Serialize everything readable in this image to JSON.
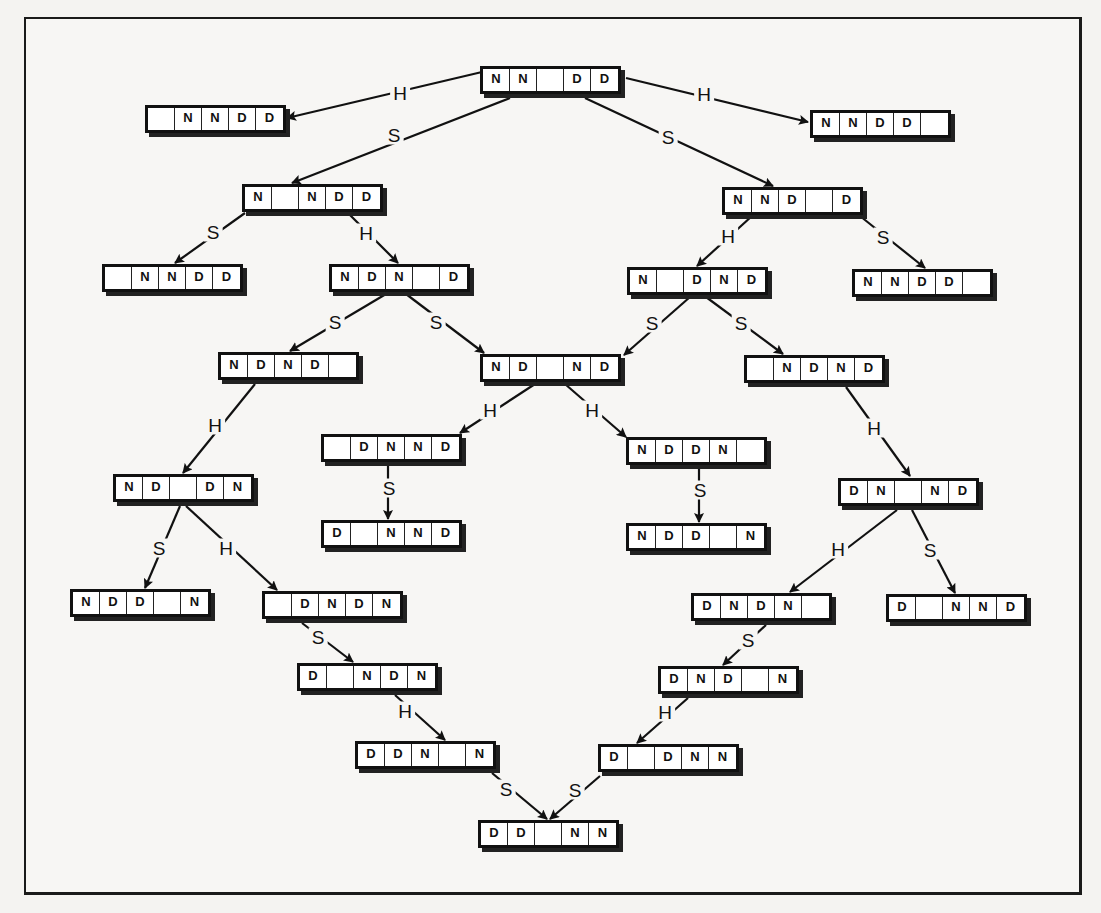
{
  "diagram": {
    "type": "state-transition-tree",
    "nodes": [
      {
        "id": "n0",
        "x": 480,
        "y": 66,
        "cells": [
          "N",
          "N",
          "",
          "D",
          "D"
        ]
      },
      {
        "id": "n1",
        "x": 145,
        "y": 105,
        "cells": [
          "",
          "N",
          "N",
          "D",
          "D"
        ]
      },
      {
        "id": "n2",
        "x": 810,
        "y": 110,
        "cells": [
          "N",
          "N",
          "D",
          "D",
          ""
        ]
      },
      {
        "id": "n3",
        "x": 242,
        "y": 184,
        "cells": [
          "N",
          "",
          "N",
          "D",
          "D"
        ]
      },
      {
        "id": "n4",
        "x": 722,
        "y": 187,
        "cells": [
          "N",
          "N",
          "D",
          "",
          "D"
        ]
      },
      {
        "id": "n5",
        "x": 102,
        "y": 264,
        "cells": [
          "",
          "N",
          "N",
          "D",
          "D"
        ]
      },
      {
        "id": "n6",
        "x": 329,
        "y": 264,
        "cells": [
          "N",
          "D",
          "N",
          "",
          "D"
        ]
      },
      {
        "id": "n7",
        "x": 627,
        "y": 267,
        "cells": [
          "N",
          "",
          "D",
          "N",
          "D"
        ]
      },
      {
        "id": "n8",
        "x": 852,
        "y": 269,
        "cells": [
          "N",
          "N",
          "D",
          "D",
          ""
        ]
      },
      {
        "id": "n9",
        "x": 218,
        "y": 352,
        "cells": [
          "N",
          "D",
          "N",
          "D",
          ""
        ]
      },
      {
        "id": "n10",
        "x": 480,
        "y": 354,
        "cells": [
          "N",
          "D",
          "",
          "N",
          "D"
        ]
      },
      {
        "id": "n11",
        "x": 744,
        "y": 355,
        "cells": [
          "",
          "N",
          "D",
          "N",
          "D"
        ]
      },
      {
        "id": "n12",
        "x": 321,
        "y": 434,
        "cells": [
          "",
          "D",
          "N",
          "N",
          "D"
        ]
      },
      {
        "id": "n13",
        "x": 626,
        "y": 437,
        "cells": [
          "N",
          "D",
          "D",
          "N",
          ""
        ]
      },
      {
        "id": "n14",
        "x": 113,
        "y": 474,
        "cells": [
          "N",
          "D",
          "",
          "D",
          "N"
        ]
      },
      {
        "id": "n15",
        "x": 321,
        "y": 520,
        "cells": [
          "D",
          "",
          "N",
          "N",
          "D"
        ]
      },
      {
        "id": "n16",
        "x": 626,
        "y": 523,
        "cells": [
          "N",
          "D",
          "D",
          "",
          "N"
        ]
      },
      {
        "id": "n17",
        "x": 838,
        "y": 478,
        "cells": [
          "D",
          "N",
          "",
          "N",
          "D"
        ]
      },
      {
        "id": "n18",
        "x": 70,
        "y": 589,
        "cells": [
          "N",
          "D",
          "D",
          "",
          "N"
        ]
      },
      {
        "id": "n19",
        "x": 262,
        "y": 591,
        "cells": [
          "",
          "D",
          "N",
          "D",
          "N"
        ]
      },
      {
        "id": "n20",
        "x": 691,
        "y": 593,
        "cells": [
          "D",
          "N",
          "D",
          "N",
          ""
        ]
      },
      {
        "id": "n21",
        "x": 886,
        "y": 594,
        "cells": [
          "D",
          "",
          "N",
          "N",
          "D"
        ]
      },
      {
        "id": "n22",
        "x": 297,
        "y": 663,
        "cells": [
          "D",
          "",
          "N",
          "D",
          "N"
        ]
      },
      {
        "id": "n23",
        "x": 658,
        "y": 666,
        "cells": [
          "D",
          "N",
          "D",
          "",
          "N"
        ]
      },
      {
        "id": "n24",
        "x": 355,
        "y": 741,
        "cells": [
          "D",
          "D",
          "N",
          "",
          "N"
        ]
      },
      {
        "id": "n25",
        "x": 598,
        "y": 744,
        "cells": [
          "D",
          "",
          "D",
          "N",
          "N"
        ]
      },
      {
        "id": "n26",
        "x": 478,
        "y": 820,
        "cells": [
          "D",
          "D",
          "",
          "N",
          "N"
        ]
      }
    ],
    "edges": [
      {
        "from": "n0",
        "to": "n1",
        "label": "H",
        "x1": 482,
        "y1": 72,
        "x2": 287,
        "y2": 118,
        "lx": 400,
        "ly": 93
      },
      {
        "from": "n0",
        "to": "n2",
        "label": "H",
        "x1": 626,
        "y1": 78,
        "x2": 808,
        "y2": 122,
        "lx": 704,
        "ly": 94
      },
      {
        "from": "n0",
        "to": "n3",
        "label": "S",
        "x1": 510,
        "y1": 98,
        "x2": 292,
        "y2": 183,
        "lx": 394,
        "ly": 135
      },
      {
        "from": "n0",
        "to": "n4",
        "label": "S",
        "x1": 585,
        "y1": 98,
        "x2": 773,
        "y2": 186,
        "lx": 668,
        "ly": 137
      },
      {
        "from": "n3",
        "to": "n5",
        "label": "S",
        "x1": 245,
        "y1": 213,
        "x2": 175,
        "y2": 263,
        "lx": 213,
        "ly": 232
      },
      {
        "from": "n3",
        "to": "n6",
        "label": "H",
        "x1": 348,
        "y1": 213,
        "x2": 398,
        "y2": 263,
        "lx": 366,
        "ly": 233
      },
      {
        "from": "n4",
        "to": "n7",
        "label": "H",
        "x1": 752,
        "y1": 216,
        "x2": 697,
        "y2": 266,
        "lx": 728,
        "ly": 236
      },
      {
        "from": "n4",
        "to": "n8",
        "label": "S",
        "x1": 860,
        "y1": 216,
        "x2": 925,
        "y2": 268,
        "lx": 883,
        "ly": 237
      },
      {
        "from": "n6",
        "to": "n9",
        "label": "S",
        "x1": 386,
        "y1": 294,
        "x2": 290,
        "y2": 351,
        "lx": 335,
        "ly": 322
      },
      {
        "from": "n6",
        "to": "n10",
        "label": "S",
        "x1": 406,
        "y1": 294,
        "x2": 484,
        "y2": 353,
        "lx": 436,
        "ly": 322
      },
      {
        "from": "n7",
        "to": "n10",
        "label": "S",
        "x1": 690,
        "y1": 297,
        "x2": 624,
        "y2": 355,
        "lx": 652,
        "ly": 323
      },
      {
        "from": "n7",
        "to": "n11",
        "label": "S",
        "x1": 706,
        "y1": 297,
        "x2": 783,
        "y2": 354,
        "lx": 741,
        "ly": 323
      },
      {
        "from": "n9",
        "to": "n14",
        "label": "H",
        "x1": 255,
        "y1": 384,
        "x2": 183,
        "y2": 473,
        "lx": 215,
        "ly": 425
      },
      {
        "from": "n10",
        "to": "n12",
        "label": "H",
        "x1": 535,
        "y1": 384,
        "x2": 460,
        "y2": 433,
        "lx": 490,
        "ly": 410
      },
      {
        "from": "n10",
        "to": "n13",
        "label": "H",
        "x1": 565,
        "y1": 384,
        "x2": 626,
        "y2": 437,
        "lx": 592,
        "ly": 410
      },
      {
        "from": "n11",
        "to": "n17",
        "label": "H",
        "x1": 846,
        "y1": 387,
        "x2": 910,
        "y2": 476,
        "lx": 874,
        "ly": 428
      },
      {
        "from": "n12",
        "to": "n15",
        "label": "S",
        "x1": 388,
        "y1": 466,
        "x2": 388,
        "y2": 519,
        "lx": 389,
        "ly": 488
      },
      {
        "from": "n13",
        "to": "n16",
        "label": "S",
        "x1": 699,
        "y1": 469,
        "x2": 699,
        "y2": 522,
        "lx": 700,
        "ly": 490
      },
      {
        "from": "n14",
        "to": "n18",
        "label": "S",
        "x1": 180,
        "y1": 506,
        "x2": 145,
        "y2": 588,
        "lx": 159,
        "ly": 548
      },
      {
        "from": "n14",
        "to": "n19",
        "label": "H",
        "x1": 186,
        "y1": 506,
        "x2": 277,
        "y2": 590,
        "lx": 226,
        "ly": 548
      },
      {
        "from": "n17",
        "to": "n20",
        "label": "H",
        "x1": 897,
        "y1": 510,
        "x2": 790,
        "y2": 592,
        "lx": 838,
        "ly": 549
      },
      {
        "from": "n17",
        "to": "n21",
        "label": "S",
        "x1": 912,
        "y1": 510,
        "x2": 955,
        "y2": 593,
        "lx": 930,
        "ly": 550
      },
      {
        "from": "n19",
        "to": "n22",
        "label": "S",
        "x1": 302,
        "y1": 623,
        "x2": 353,
        "y2": 662,
        "lx": 318,
        "ly": 637
      },
      {
        "from": "n20",
        "to": "n23",
        "label": "S",
        "x1": 766,
        "y1": 625,
        "x2": 723,
        "y2": 665,
        "lx": 748,
        "ly": 640
      },
      {
        "from": "n22",
        "to": "n24",
        "label": "H",
        "x1": 395,
        "y1": 695,
        "x2": 445,
        "y2": 740,
        "lx": 405,
        "ly": 711
      },
      {
        "from": "n23",
        "to": "n25",
        "label": "H",
        "x1": 688,
        "y1": 698,
        "x2": 637,
        "y2": 743,
        "lx": 665,
        "ly": 712
      },
      {
        "from": "n24",
        "to": "n26",
        "label": "S",
        "x1": 492,
        "y1": 773,
        "x2": 547,
        "y2": 819,
        "lx": 506,
        "ly": 789
      },
      {
        "from": "n25",
        "to": "n26",
        "label": "S",
        "x1": 600,
        "y1": 776,
        "x2": 550,
        "y2": 819,
        "lx": 575,
        "ly": 790
      }
    ]
  }
}
